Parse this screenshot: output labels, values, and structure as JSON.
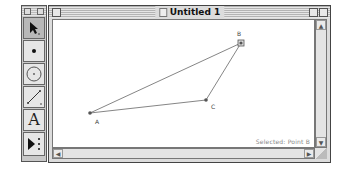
{
  "palette": {
    "tools": [
      {
        "name": "arrow-tool",
        "icon": "arrow-icon",
        "active": true
      },
      {
        "name": "point-tool",
        "icon": "point-icon"
      },
      {
        "name": "compass-tool",
        "icon": "compass-icon"
      },
      {
        "name": "straightedge-tool",
        "icon": "segment-icon"
      },
      {
        "name": "text-tool",
        "icon": "text-icon",
        "label": "A"
      },
      {
        "name": "custom-tool",
        "icon": "custom-tool-icon"
      }
    ]
  },
  "window": {
    "title": "Untitled 1",
    "status": "Selected: Point B"
  },
  "sketch": {
    "points": [
      {
        "label": "A",
        "x": 89,
        "y": 112
      },
      {
        "label": "B",
        "x": 240,
        "y": 42,
        "selected": true
      },
      {
        "label": "C",
        "x": 205,
        "y": 99
      }
    ],
    "segments": [
      [
        "A",
        "B"
      ],
      [
        "A",
        "C"
      ],
      [
        "C",
        "B"
      ]
    ]
  },
  "colors": {
    "line": "#666666",
    "point": "#555555"
  },
  "scrollbars": {
    "up": "▲",
    "down": "▼",
    "left": "◀",
    "right": "▶"
  }
}
